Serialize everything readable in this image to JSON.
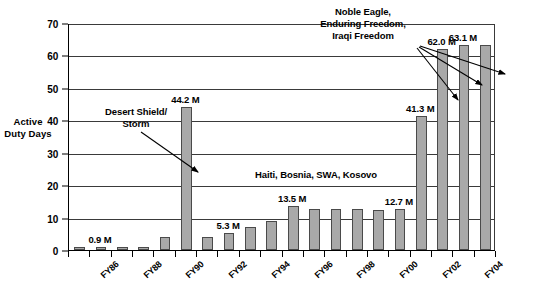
{
  "chart_data": {
    "type": "bar",
    "title": "",
    "xlabel": "",
    "ylabel": "Active Duty Days",
    "ylim": [
      0,
      70
    ],
    "yticks": [
      0,
      10,
      20,
      30,
      40,
      50,
      60,
      70
    ],
    "grid": true,
    "legend": "none",
    "categories": [
      "FY85",
      "FY86",
      "FY87",
      "FY88",
      "FY89",
      "FY90",
      "FY91",
      "FY92",
      "FY93",
      "FY94",
      "FY95",
      "FY96",
      "FY97",
      "FY98",
      "FY99",
      "FY00",
      "FY01",
      "FY02",
      "FY03",
      "FY04"
    ],
    "xtick_labels": [
      "FY86",
      "FY88",
      "FY90",
      "FY92",
      "FY94",
      "FY96",
      "FY98",
      "FY00",
      "FY02",
      "FY04"
    ],
    "values": [
      0.9,
      0.9,
      0.9,
      0.9,
      4.0,
      44.2,
      4.0,
      5.3,
      7.0,
      8.9,
      13.5,
      12.8,
      12.6,
      12.6,
      12.4,
      12.7,
      41.3,
      62.0,
      63.1,
      63.1
    ],
    "bars": [
      {
        "category": "FY85",
        "value": 0.9,
        "label": ""
      },
      {
        "category": "FY86",
        "value": 0.9,
        "label": "0.9 M"
      },
      {
        "category": "FY87",
        "value": 0.9,
        "label": ""
      },
      {
        "category": "FY88",
        "value": 0.9,
        "label": ""
      },
      {
        "category": "FY89",
        "value": 4.0,
        "label": ""
      },
      {
        "category": "FY90",
        "value": 44.2,
        "label": "44.2 M"
      },
      {
        "category": "FY91",
        "value": 4.0,
        "label": ""
      },
      {
        "category": "FY92",
        "value": 5.3,
        "label": "5.3 M"
      },
      {
        "category": "FY93",
        "value": 7.0,
        "label": ""
      },
      {
        "category": "FY94",
        "value": 8.9,
        "label": ""
      },
      {
        "category": "FY95",
        "value": 13.5,
        "label": "13.5 M"
      },
      {
        "category": "FY96",
        "value": 12.8,
        "label": ""
      },
      {
        "category": "FY97",
        "value": 12.6,
        "label": ""
      },
      {
        "category": "FY98",
        "value": 12.6,
        "label": ""
      },
      {
        "category": "FY99",
        "value": 12.4,
        "label": ""
      },
      {
        "category": "FY00",
        "value": 12.7,
        "label": "12.7 M"
      },
      {
        "category": "FY01",
        "value": 41.3,
        "label": "41.3 M"
      },
      {
        "category": "FY02",
        "value": 62.0,
        "label": "62.0 M"
      },
      {
        "category": "FY03",
        "value": 63.1,
        "label": "63.1 M"
      },
      {
        "category": "FY04",
        "value": 63.1,
        "label": ""
      }
    ],
    "annotations": [
      {
        "name": "desert-shield-storm",
        "text": "Desert Shield/\nStorm",
        "points_to": "44.2 M"
      },
      {
        "name": "haiti-bosnia-swa-kosovo",
        "text": "Haiti, Bosnia, SWA, Kosovo",
        "points_to": ""
      },
      {
        "name": "noble-eagle-enduring-iraqi",
        "text": "Noble Eagle,\nEnduring Freedom,\nIraqi Freedom",
        "points_to": "41.3 M, 62.0 M, 63.1 M"
      }
    ],
    "colors": {
      "bar_fill": "#a9a9a9",
      "bar_border": "#4a4a4a",
      "gridline": "#3a3a3a",
      "axis": "#000000",
      "text": "#000000",
      "background": "#ffffff"
    }
  },
  "axis": {
    "y_title": "Active Duty Days"
  }
}
